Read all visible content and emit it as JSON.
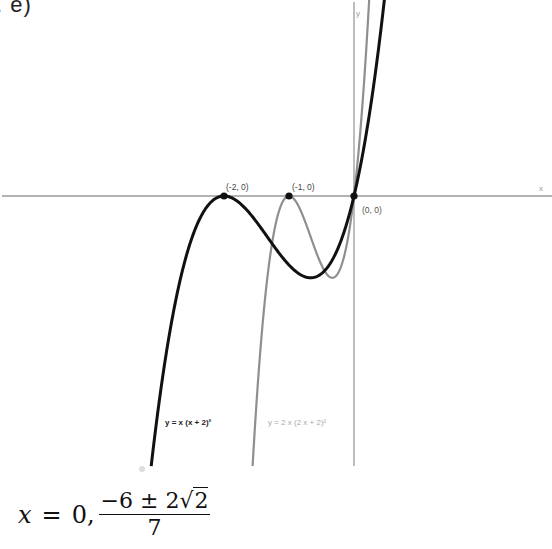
{
  "problem_label": ". e)",
  "chart_data": {
    "type": "line",
    "title": "",
    "xlabel": "x",
    "ylabel": "y",
    "grid": false,
    "xlim": [
      -5.45,
      3.05
    ],
    "ylim": [
      -3.9,
      2.85
    ],
    "series": [
      {
        "name": "y = x (x + 2)²",
        "expression": "x*(x+2)^2",
        "color": "#111111",
        "x": [
          -3.12,
          -3.0,
          -2.75,
          -2.5,
          -2.25,
          -2.0,
          -1.75,
          -1.5,
          -1.25,
          -1.0,
          -0.667,
          -0.5,
          -0.25,
          0.0,
          0.25,
          0.48
        ],
        "y": [
          -3.91,
          -3.0,
          -1.55,
          -0.63,
          -0.14,
          0.0,
          -0.11,
          -0.38,
          -0.7,
          -1.0,
          -1.185,
          -1.13,
          -0.77,
          0.0,
          1.27,
          2.95
        ]
      },
      {
        "name": "y = 2 x (2 x + 2)²",
        "expression": "2*x*(2*x+2)^2",
        "color": "#8a8a8a",
        "x": [
          -1.56,
          -1.5,
          -1.375,
          -1.25,
          -1.125,
          -1.0,
          -0.875,
          -0.75,
          -0.625,
          -0.5,
          -0.333,
          -0.25,
          -0.125,
          0.0,
          0.125,
          0.23
        ],
        "y": [
          -3.91,
          -3.0,
          -1.55,
          -0.63,
          -0.14,
          0.0,
          -0.11,
          -0.38,
          -0.7,
          -1.0,
          -1.185,
          -1.13,
          -0.77,
          0.0,
          1.27,
          2.79
        ]
      }
    ],
    "points": [
      {
        "label": "(-2, 0)",
        "x": -2,
        "y": 0
      },
      {
        "label": "(-1, 0)",
        "x": -1,
        "y": 0
      },
      {
        "label": "(0, 0)",
        "x": 0,
        "y": 0
      }
    ],
    "legend": [
      {
        "text": "y = x (x + 2)²",
        "color": "#111111"
      },
      {
        "text": "y = 2 x (2 x + 2)²",
        "color": "#9a9a9a"
      }
    ]
  },
  "plot": {
    "x_axis_label": "x",
    "y_axis_label": "y",
    "point_labels": [
      "(-2, 0)",
      "(-1, 0)",
      "(0, 0)"
    ],
    "legend_black": "y = x (x + 2)²",
    "legend_grey": "y = 2 x (2 x + 2)²"
  },
  "answer": {
    "lhs": "x",
    "equals": "=",
    "first_root": "0,",
    "numerator_prefix": "−6 ± 2",
    "sqrt_symbol": "√",
    "sqrt_arg": "2",
    "denominator": "7"
  }
}
